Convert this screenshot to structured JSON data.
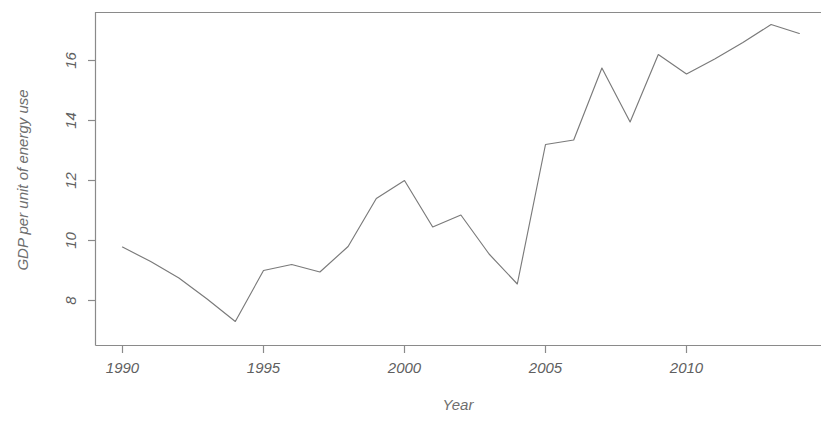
{
  "chart_data": {
    "type": "line",
    "title": "",
    "xlabel": "Year",
    "ylabel": "GDP per unit of energy use",
    "xlim": [
      1989.0,
      1914.0
    ],
    "x_axis_range": [
      1988.95,
      2014.6
    ],
    "ylim": [
      7.0,
      17.6
    ],
    "grid": false,
    "legend": "none",
    "x_tick_labels": [
      "1990",
      "1995",
      "2000",
      "2005",
      "2010"
    ],
    "x_tick_values": [
      1990,
      1995,
      2000,
      2005,
      2010
    ],
    "y_tick_labels": [
      "8",
      "10",
      "12",
      "14",
      "16"
    ],
    "y_tick_values": [
      8,
      10,
      12,
      14,
      16
    ],
    "x": [
      1990,
      1991,
      1992,
      1993,
      1994,
      1995,
      1996,
      1997,
      1998,
      1999,
      2000,
      2001,
      2002,
      2003,
      2004,
      2005,
      2006,
      2007,
      2008,
      2009,
      2010,
      2011,
      2012,
      2013,
      2014
    ],
    "values": [
      9.78,
      9.3,
      8.75,
      8.05,
      7.3,
      9.0,
      9.2,
      8.95,
      9.8,
      11.4,
      12.0,
      10.45,
      10.85,
      9.55,
      8.55,
      13.2,
      13.35,
      15.75,
      13.95,
      16.2,
      15.55,
      16.05,
      16.6,
      17.2,
      16.9
    ],
    "series": [
      {
        "name": "GDP per unit of energy use",
        "values": [
          9.78,
          9.3,
          8.75,
          8.05,
          7.3,
          9.0,
          9.2,
          8.95,
          9.8,
          11.4,
          12.0,
          10.45,
          10.85,
          9.55,
          8.55,
          13.2,
          13.35,
          15.75,
          13.95,
          16.2,
          15.55,
          16.05,
          16.6,
          17.2,
          16.9
        ]
      }
    ],
    "line_color": "#7a7a7a",
    "axis_color": "#8a8a8a",
    "background_color": "#ffffff"
  },
  "axis": {
    "x_label": "Year",
    "y_label": "GDP per unit of energy use",
    "x_ticks": [
      "1990",
      "1995",
      "2000",
      "2005",
      "2010"
    ],
    "y_ticks": [
      "8",
      "10",
      "12",
      "14",
      "16"
    ]
  }
}
